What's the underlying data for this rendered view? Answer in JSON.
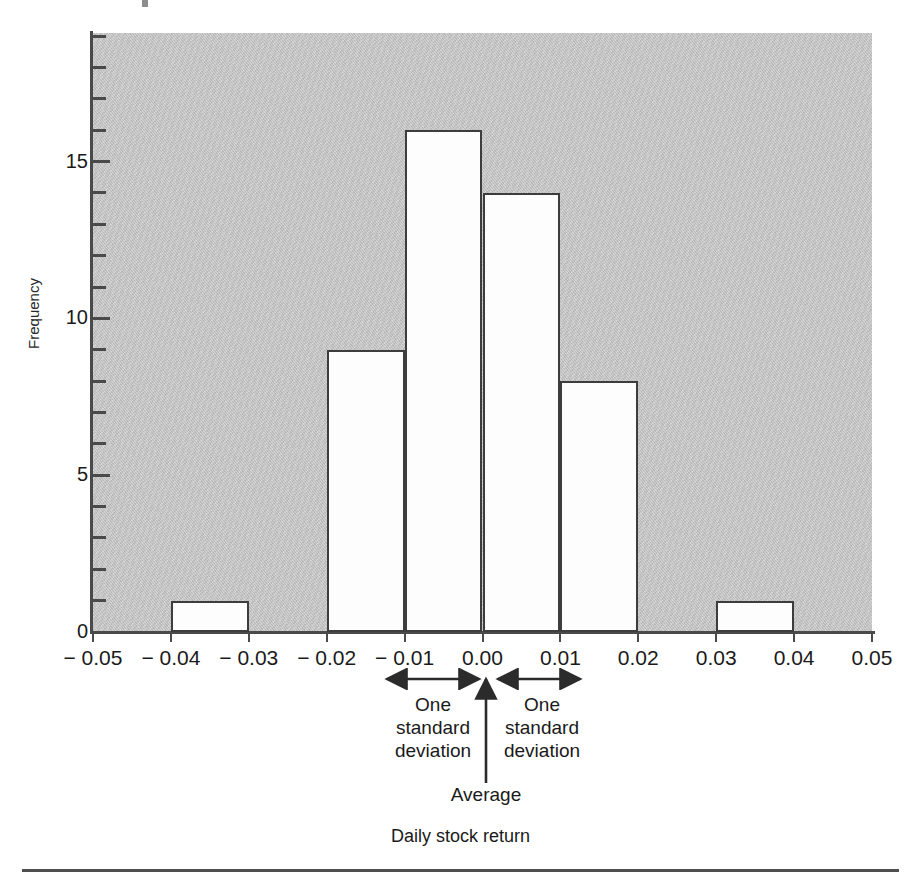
{
  "chart_data": {
    "type": "bar",
    "title": "",
    "subtitle": "",
    "xlabel": "Daily stock return",
    "ylabel": "Frequency",
    "xlim": [
      -0.05,
      0.05
    ],
    "ylim": [
      0,
      19.1
    ],
    "grid": false,
    "legend": null,
    "bin_width": 0.01,
    "bin_edges": [
      -0.05,
      -0.04,
      -0.03,
      -0.02,
      -0.01,
      0.0,
      0.01,
      0.02,
      0.03,
      0.04,
      0.05
    ],
    "categories": [
      "-0.05 to -0.04",
      "-0.04 to -0.03",
      "-0.03 to -0.02",
      "-0.02 to -0.01",
      "-0.01 to 0.00",
      "0.00 to 0.01",
      "0.01 to 0.02",
      "0.02 to 0.03",
      "0.03 to 0.04",
      "0.04 to 0.05"
    ],
    "values": [
      0,
      1,
      0,
      9,
      16,
      14,
      8,
      0,
      1,
      0
    ],
    "bars": [
      {
        "x0": -0.04,
        "x1": -0.03,
        "value": 1
      },
      {
        "x0": -0.02,
        "x1": -0.01,
        "value": 9
      },
      {
        "x0": -0.01,
        "x1": 0.0,
        "value": 16
      },
      {
        "x0": 0.0,
        "x1": 0.01,
        "value": 14
      },
      {
        "x0": 0.01,
        "x1": 0.02,
        "value": 8
      },
      {
        "x0": 0.03,
        "x1": 0.04,
        "value": 1
      }
    ],
    "x_ticks": [
      -0.05,
      -0.04,
      -0.03,
      -0.02,
      -0.01,
      0.0,
      0.01,
      0.02,
      0.03,
      0.04,
      0.05
    ],
    "x_tick_labels": [
      "− 0.05",
      "− 0.04",
      "− 0.03",
      "− 0.02",
      "− 0.01",
      "0.00",
      "0.01",
      "0.02",
      "0.03",
      "0.04",
      "0.05"
    ],
    "y_ticks_major": [
      0,
      5,
      10,
      15
    ],
    "y_tick_labels_major": [
      "0",
      "5",
      "10",
      "15"
    ],
    "y_ticks_minor": [
      1,
      2,
      3,
      4,
      6,
      7,
      8,
      9,
      11,
      12,
      13,
      14,
      16,
      17,
      18
    ],
    "annotations": [
      {
        "name": "one-std-dev-left",
        "text": "One\nstandard\ndeviation",
        "from": -0.01,
        "to": 0.0,
        "arrow": "double"
      },
      {
        "name": "one-std-dev-right",
        "text": "One\nstandard\ndeviation",
        "from": 0.0,
        "to": 0.01,
        "arrow": "double"
      },
      {
        "name": "average-marker",
        "text": "Average",
        "at": 0.0,
        "arrow": "up"
      }
    ],
    "colors": {
      "plot_background": "#c9c9c9",
      "bar_fill": "#fdfdfd",
      "bar_stroke": "#3d3d3d",
      "axis": "#4a4a4a",
      "text": "#1a1a1a",
      "page_background": "#ffffff"
    }
  },
  "axis": {
    "y_title": "Frequency",
    "x_caption": "Daily stock return"
  },
  "annotations": {
    "left_std": "One\nstandard\ndeviation",
    "right_std": "One\nstandard\ndeviation",
    "average": "Average"
  }
}
